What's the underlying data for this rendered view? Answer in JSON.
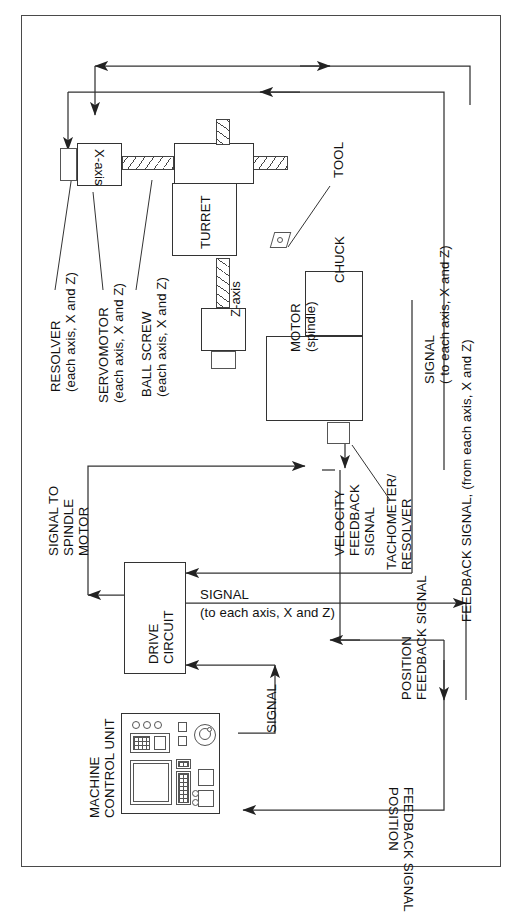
{
  "diagram": {
    "line_color": "#333333",
    "frame_color": "#4a4a4a"
  },
  "blocks": {
    "x_axis": "X-axis",
    "z_axis": "Z-axis",
    "turret": "TURRET",
    "chuck": "CHUCK",
    "motor_spindle_line1": "MOTOR",
    "motor_spindle_line2": "(spindle)",
    "drive_circuit_line1": "DRIVE",
    "drive_circuit_line2": "CIRCUIT"
  },
  "callouts": {
    "tool": "TOOL",
    "resolver_line1": "RESOLVER",
    "resolver_line2": "(each axis, X and Z)",
    "servomotor_line1": "SERVOMOTOR",
    "servomotor_line2": "(each axis, X and Z)",
    "ball_screw_line1": "BALL SCREW",
    "ball_screw_line2": "(each axis, X and Z)",
    "machine_control_unit_line1": "MACHINE",
    "machine_control_unit_line2": "CONTROL UNIT"
  },
  "signals": {
    "signal_to_spindle_motor_line1": "SIGNAL TO",
    "signal_to_spindle_motor_line2": "SPINDLE",
    "signal_to_spindle_motor_line3": "MOTOR",
    "velocity_feedback_line1": "VELOCITY",
    "velocity_feedback_line2": "FEEDBACK",
    "velocity_feedback_line3": "SIGNAL",
    "tachometer_resolver_line1": "TACHOMETER/",
    "tachometer_resolver_line2": "RESOLVER",
    "signal_each_axis_right_line1": "SIGNAL",
    "signal_each_axis_right_line2": "( to each axis, X and Z)",
    "feedback_signal_right_line1": "FEEDBACK SIGNAL, (from each axis, X and Z)",
    "signal_drive_line1": "SIGNAL",
    "signal_drive_line2": "(to each axis, X and Z)",
    "signal_mcu": "SIGNAL",
    "position_feedback_line1": "POSITION",
    "position_feedback_line2": "FEEDBACK SIGNAL"
  }
}
